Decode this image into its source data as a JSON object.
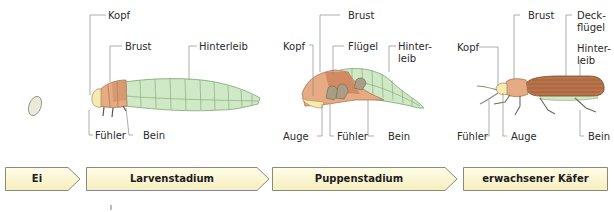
{
  "diagram": {
    "colors": {
      "head": "#f7eab0",
      "thorax": "#e7ab84",
      "thorax_dark": "#c97f57",
      "abdomen": "#cfe8c6",
      "abdomen_line": "#7fa36f",
      "elytra": "#b8734a",
      "egg": "#ece9d9",
      "stage_fill": "#fdf8d8",
      "stage_border": "#8a8a7a",
      "leader_line": "#8a8a8a"
    },
    "egg": {
      "label": ""
    },
    "larva": {
      "labels": {
        "kopf": "Kopf",
        "brust": "Brust",
        "hinterleib": "Hinterleib",
        "fuehler": "Fühler",
        "bein": "Bein"
      }
    },
    "pupa": {
      "labels": {
        "brust": "Brust",
        "kopf": "Kopf",
        "fluegel": "Flügel",
        "hinterleib_1": "Hinter-",
        "hinterleib_2": "leib",
        "auge": "Auge",
        "fuehler": "Fühler",
        "bein": "Bein"
      }
    },
    "adult": {
      "labels": {
        "brust": "Brust",
        "deckfluegel_1": "Deck-",
        "deckfluegel_2": "flügel",
        "kopf": "Kopf",
        "hinterleib_1": "Hinter-",
        "hinterleib_2": "leib",
        "fuehler": "Fühler",
        "auge": "Auge",
        "bein": "Bein"
      }
    },
    "stages": [
      {
        "label": "Ei"
      },
      {
        "label": "Larvenstadium"
      },
      {
        "label": "Puppenstadium"
      },
      {
        "label": "erwachsener Käfer"
      }
    ]
  }
}
